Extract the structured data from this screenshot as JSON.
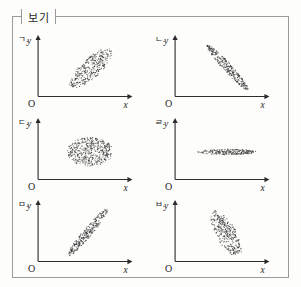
{
  "frame": {
    "label": "보기",
    "border_color": "#9a9a9a",
    "background": "#fdfdfc"
  },
  "axis_labels": {
    "x": "x",
    "y": "y",
    "origin": "O"
  },
  "panels": [
    {
      "tag": "ㄱ.",
      "tag_full": "ㄱ. y",
      "relationship": "moderate positive correlation",
      "cloud": {
        "shape": "ellipse",
        "cx": 0.56,
        "cy": 0.46,
        "rx": 0.3,
        "ry": 0.165,
        "angle_deg": -42,
        "points": 330,
        "dot_radius": 0.55
      }
    },
    {
      "tag": "ㄴ.",
      "tag_full": "ㄴ. y",
      "relationship": "strong negative correlation",
      "cloud": {
        "shape": "ellipse",
        "cx": 0.56,
        "cy": 0.47,
        "rx": 0.34,
        "ry": 0.072,
        "angle_deg": 47,
        "points": 300,
        "dot_radius": 0.55
      }
    },
    {
      "tag": "ㄷ.",
      "tag_full": "ㄷ. y",
      "relationship": "no correlation (circular)",
      "cloud": {
        "shape": "ellipse",
        "cx": 0.55,
        "cy": 0.46,
        "rx": 0.245,
        "ry": 0.245,
        "angle_deg": 0,
        "points": 560,
        "dot_radius": 0.5
      }
    },
    {
      "tag": "ㄹ.",
      "tag_full": "ㄹ. y",
      "relationship": "no correlation (horizontal band)",
      "cloud": {
        "shape": "ellipse",
        "cx": 0.55,
        "cy": 0.45,
        "rx": 0.32,
        "ry": 0.047,
        "angle_deg": 0,
        "points": 280,
        "dot_radius": 0.5
      }
    },
    {
      "tag": "ㅁ.",
      "tag_full": "ㅁ. y",
      "relationship": "strong positive correlation",
      "cloud": {
        "shape": "ellipse",
        "cx": 0.53,
        "cy": 0.48,
        "rx": 0.33,
        "ry": 0.075,
        "angle_deg": -50,
        "points": 290,
        "dot_radius": 0.55
      }
    },
    {
      "tag": "ㅂ.",
      "tag_full": "ㅂ. y",
      "relationship": "moderate negative correlation",
      "cloud": {
        "shape": "ellipse",
        "cx": 0.54,
        "cy": 0.46,
        "rx": 0.28,
        "ry": 0.165,
        "angle_deg": 60,
        "points": 330,
        "dot_radius": 0.55
      }
    }
  ],
  "chart_data": {
    "type": "scatter",
    "title": "보기",
    "xlabel": "x",
    "ylabel": "y",
    "grid": false,
    "legend": "none",
    "panel_count": 6,
    "layout": "2 columns x 3 rows",
    "series": [
      {
        "name": "ㄱ.",
        "correlation": 0.75,
        "description": "Moderately elongated ellipse tilted upward to the right; positive correlation.",
        "orientation_deg": 42,
        "spread": "moderate"
      },
      {
        "name": "ㄴ.",
        "correlation": -0.93,
        "description": "Narrow ellipse tilted downward to the right; strong negative correlation.",
        "orientation_deg": -47,
        "spread": "tight"
      },
      {
        "name": "ㄷ.",
        "correlation": 0.0,
        "description": "Circular cloud of points; no correlation.",
        "orientation_deg": 0,
        "spread": "wide"
      },
      {
        "name": "ㄹ.",
        "correlation": 0.0,
        "description": "Flat horizontal band of points; no correlation.",
        "orientation_deg": 0,
        "spread": "very tight vertically"
      },
      {
        "name": "ㅁ.",
        "correlation": 0.95,
        "description": "Narrow ellipse tilted upward to the right; strong positive correlation.",
        "orientation_deg": 50,
        "spread": "tight"
      },
      {
        "name": "ㅂ.",
        "correlation": -0.7,
        "description": "Moderately elongated ellipse tilted downward to the right; negative correlation.",
        "orientation_deg": -60,
        "spread": "moderate"
      }
    ]
  }
}
